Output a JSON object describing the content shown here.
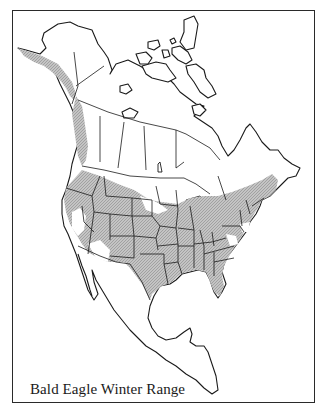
{
  "map": {
    "title": "Bald Eagle Winter Range",
    "region": "North America",
    "legend": {
      "shaded": "winter range"
    },
    "colors": {
      "range_fill": "#b8b8b8",
      "outline": "#1a1a1a",
      "background": "#ffffff"
    }
  }
}
